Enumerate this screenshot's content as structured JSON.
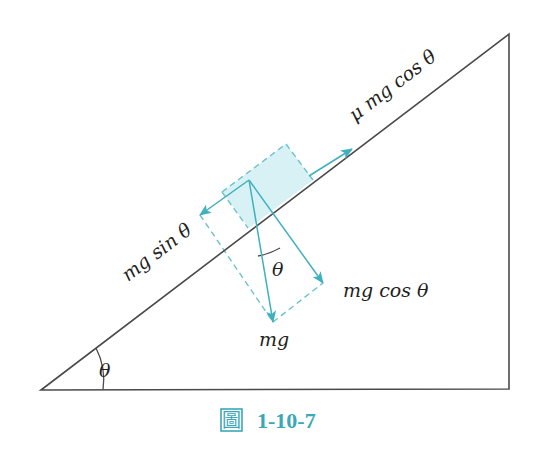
{
  "figure": {
    "caption_char": "圖",
    "caption_number": "1-10-7",
    "caption_color": "#3aa8b8"
  },
  "colors": {
    "incline": "#4a4a4a",
    "vector": "#3fb0be",
    "box_fill": "#d8f1f4",
    "dashed": "#6ec2cc",
    "text": "#231f20"
  },
  "incline": {
    "angle_label": "θ",
    "vertices": [
      [
        41,
        390
      ],
      [
        509,
        34
      ],
      [
        509,
        389
      ]
    ]
  },
  "forces": {
    "friction": {
      "label": "μ mg cos θ"
    },
    "parallel": {
      "label": "mg sin θ"
    },
    "perpendicular": {
      "label": "mg cos θ"
    },
    "weight": {
      "label": "mg"
    },
    "between_angle": {
      "label": "θ"
    }
  }
}
